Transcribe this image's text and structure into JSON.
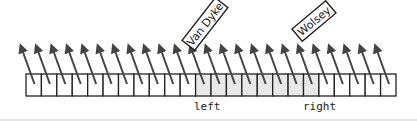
{
  "diagram": {
    "cell_count": 24,
    "shaded_range": [
      11,
      18
    ],
    "colors": {
      "stroke": "#222222",
      "arrow": "#444444",
      "shaded_fill": "#e8e8e8",
      "cell_fill": "#ffffff"
    },
    "pointers": [
      {
        "label": "left",
        "cell_index": 11
      },
      {
        "label": "right",
        "cell_index": 18
      }
    ],
    "callouts": [
      {
        "label": "Van Dyke",
        "cell_index": 12
      },
      {
        "label": "Wolsey",
        "cell_index": 18
      }
    ]
  }
}
